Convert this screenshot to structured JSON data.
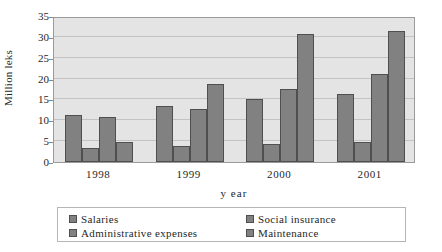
{
  "chart_data": {
    "type": "bar",
    "title": "",
    "xlabel": "y ear",
    "ylabel": "Million leks",
    "categories": [
      "1998",
      "1999",
      "2000",
      "2001"
    ],
    "ylim": [
      0,
      35
    ],
    "yticks": [
      0,
      5,
      10,
      15,
      20,
      25,
      30,
      35
    ],
    "ytick_labels": [
      "0",
      "5",
      "10",
      "15",
      "20",
      "25",
      "30",
      "35"
    ],
    "grid": true,
    "legend_position": "bottom",
    "series": [
      {
        "name": "Salaries",
        "values": [
          11.2,
          13.5,
          15.0,
          16.2
        ],
        "color": "#818181"
      },
      {
        "name": "Social insurance",
        "values": [
          3.3,
          3.8,
          4.3,
          4.8
        ],
        "color": "#818181"
      },
      {
        "name": "Administrative expenses",
        "values": [
          10.8,
          12.8,
          17.5,
          21.0
        ],
        "color": "#818181"
      },
      {
        "name": "Maintenance",
        "values": [
          4.8,
          18.8,
          30.7,
          31.3
        ],
        "color": "#818181"
      }
    ]
  },
  "style": {
    "plot_background": "#e4e4e4",
    "gridline_color": "#c3c3c3",
    "bar_fill": "#818181",
    "bar_border": "#4f4f4f",
    "axis_color": "#9a9a9a",
    "text_color": "#1f1f1f",
    "page_background": "#ffffff"
  }
}
